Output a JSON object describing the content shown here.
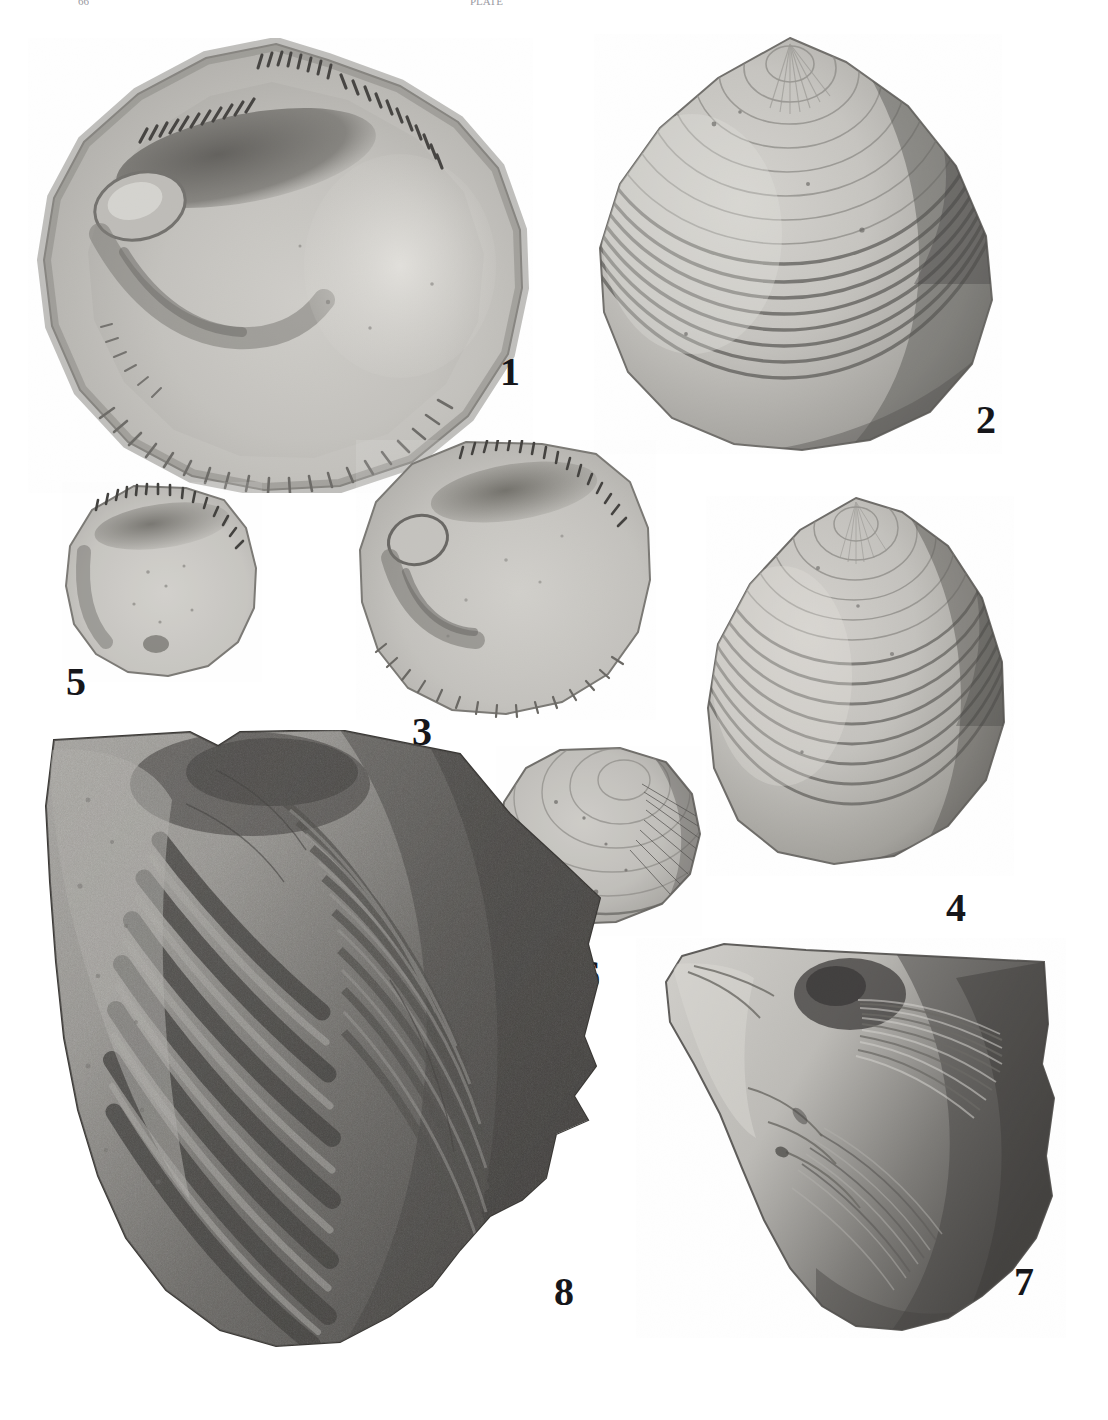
{
  "plate": {
    "kind": "paleontological-figure-plate",
    "background_color": "#ffffff",
    "ink_color": "#16161a",
    "width": 1108,
    "height": 1420,
    "top_crop_left_text": "66",
    "top_crop_right_text": "PLATE"
  },
  "figures": [
    {
      "number": "1",
      "name": "bivalve-interior-large-left",
      "view": "interior of left valve",
      "description": "Large rounded-triangular bivalve interior showing taxodont hinge teeth along the dorsal margin, large anterior adductor muscle scar, pallial line and strongly crenulate ventral margin",
      "label_x": 500,
      "label_y": 352,
      "label_size": 40
    },
    {
      "number": "2",
      "name": "bivalve-exterior-large-right",
      "view": "exterior of right valve",
      "description": "Large subtriangular bivalve exterior with fine concentric growth lines and coarser concentric ribs toward the ventral margin; beak at upper centre",
      "label_x": 976,
      "label_y": 400,
      "label_size": 40
    },
    {
      "number": "3",
      "name": "bivalve-interior-medium",
      "view": "interior of valve",
      "description": "Medium rounded bivalve interior with short row of hinge denticles, oval anterior muscle scar and crenulate ventral margin",
      "label_x": 412,
      "label_y": 712,
      "label_size": 40
    },
    {
      "number": "4",
      "name": "bivalve-exterior-medium",
      "view": "exterior of valve",
      "description": "Medium subtriangular bivalve exterior with concentric growth rings, beak at top",
      "label_x": 946,
      "label_y": 888,
      "label_size": 40
    },
    {
      "number": "5",
      "name": "bivalve-interior-small",
      "view": "interior of valve",
      "description": "Small oval bivalve interior, hinge plate with row of small teeth along the upper margin",
      "label_x": 66,
      "label_y": 662,
      "label_size": 40
    },
    {
      "number": "6",
      "name": "bivalve-exterior-small",
      "view": "exterior of valve",
      "description": "Small elongate-oval bivalve exterior with faint concentric growth lines and fine radial striae at the posterior",
      "label_x": 580,
      "label_y": 955,
      "label_size": 40
    },
    {
      "number": "7",
      "name": "shell-fragment-internal-mold",
      "view": "internal mold / shell fragment",
      "description": "Irregular shell fragment or internal mold with radiating wrinkled ornament, dark shading on the right half",
      "label_x": 1014,
      "label_y": 1262,
      "label_size": 40
    },
    {
      "number": "8",
      "name": "shell-in-matrix-concentric-ribbed",
      "view": "exterior, in matrix",
      "description": "Large shell preserved in rock matrix showing strong, broad, dark concentric ribs curving from the upper-left umbo toward the lower right",
      "label_x": 554,
      "label_y": 1272,
      "label_size": 40
    }
  ]
}
